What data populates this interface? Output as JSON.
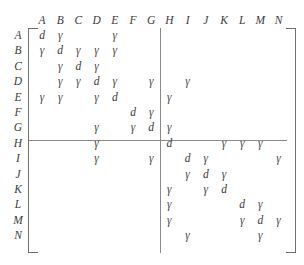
{
  "figure": {
    "type": "block-partitioned-matrix",
    "symbols": {
      "diagonal": "d",
      "offdiagonal": "γ"
    },
    "partition": {
      "after_column": "G",
      "after_row": "G"
    }
  },
  "columns": [
    "A",
    "B",
    "C",
    "D",
    "E",
    "F",
    "G",
    "H",
    "I",
    "J",
    "K",
    "L",
    "M",
    "N"
  ],
  "rows": [
    "A",
    "B",
    "C",
    "D",
    "E",
    "F",
    "G",
    "H",
    "I",
    "J",
    "K",
    "L",
    "M",
    "N"
  ],
  "matrix": [
    {
      "row": "A",
      "cells": [
        {
          "col": "A",
          "value": "d"
        },
        {
          "col": "B",
          "value": "γ"
        },
        {
          "col": "E",
          "value": "γ"
        }
      ]
    },
    {
      "row": "B",
      "cells": [
        {
          "col": "A",
          "value": "γ"
        },
        {
          "col": "B",
          "value": "d"
        },
        {
          "col": "C",
          "value": "γ"
        },
        {
          "col": "D",
          "value": "γ"
        },
        {
          "col": "E",
          "value": "γ"
        }
      ]
    },
    {
      "row": "C",
      "cells": [
        {
          "col": "B",
          "value": "γ"
        },
        {
          "col": "C",
          "value": "d"
        },
        {
          "col": "D",
          "value": "γ"
        }
      ]
    },
    {
      "row": "D",
      "cells": [
        {
          "col": "B",
          "value": "γ"
        },
        {
          "col": "C",
          "value": "γ"
        },
        {
          "col": "D",
          "value": "d"
        },
        {
          "col": "E",
          "value": "γ"
        },
        {
          "col": "G",
          "value": "γ"
        },
        {
          "col": "I",
          "value": "γ"
        }
      ]
    },
    {
      "row": "E",
      "cells": [
        {
          "col": "A",
          "value": "γ"
        },
        {
          "col": "B",
          "value": "γ"
        },
        {
          "col": "D",
          "value": "γ"
        },
        {
          "col": "E",
          "value": "d"
        },
        {
          "col": "H",
          "value": "γ"
        }
      ]
    },
    {
      "row": "F",
      "cells": [
        {
          "col": "F",
          "value": "d"
        },
        {
          "col": "G",
          "value": "γ"
        }
      ]
    },
    {
      "row": "G",
      "cells": [
        {
          "col": "D",
          "value": "γ"
        },
        {
          "col": "F",
          "value": "γ"
        },
        {
          "col": "G",
          "value": "d"
        },
        {
          "col": "H",
          "value": "γ"
        }
      ]
    },
    {
      "row": "H",
      "cells": [
        {
          "col": "D",
          "value": "γ"
        },
        {
          "col": "H",
          "value": "d"
        },
        {
          "col": "K",
          "value": "γ"
        },
        {
          "col": "L",
          "value": "γ"
        },
        {
          "col": "M",
          "value": "γ"
        }
      ]
    },
    {
      "row": "I",
      "cells": [
        {
          "col": "D",
          "value": "γ"
        },
        {
          "col": "G",
          "value": "γ"
        },
        {
          "col": "I",
          "value": "d"
        },
        {
          "col": "J",
          "value": "γ"
        },
        {
          "col": "N",
          "value": "γ"
        }
      ]
    },
    {
      "row": "J",
      "cells": [
        {
          "col": "I",
          "value": "γ"
        },
        {
          "col": "J",
          "value": "d"
        },
        {
          "col": "K",
          "value": "γ"
        }
      ]
    },
    {
      "row": "K",
      "cells": [
        {
          "col": "H",
          "value": "γ"
        },
        {
          "col": "J",
          "value": "γ"
        },
        {
          "col": "K",
          "value": "d"
        }
      ]
    },
    {
      "row": "L",
      "cells": [
        {
          "col": "H",
          "value": "γ"
        },
        {
          "col": "L",
          "value": "d"
        },
        {
          "col": "M",
          "value": "γ"
        }
      ]
    },
    {
      "row": "M",
      "cells": [
        {
          "col": "H",
          "value": "γ"
        },
        {
          "col": "L",
          "value": "γ"
        },
        {
          "col": "M",
          "value": "d"
        },
        {
          "col": "N",
          "value": "γ"
        }
      ]
    },
    {
      "row": "N",
      "cells": [
        {
          "col": "I",
          "value": "γ"
        },
        {
          "col": "M",
          "value": "γ"
        }
      ]
    }
  ],
  "colors": {
    "text": "#3c3c3c",
    "rule": "#8a8a8a",
    "bracket": "#6f6f6f",
    "background": "#ffffff"
  }
}
